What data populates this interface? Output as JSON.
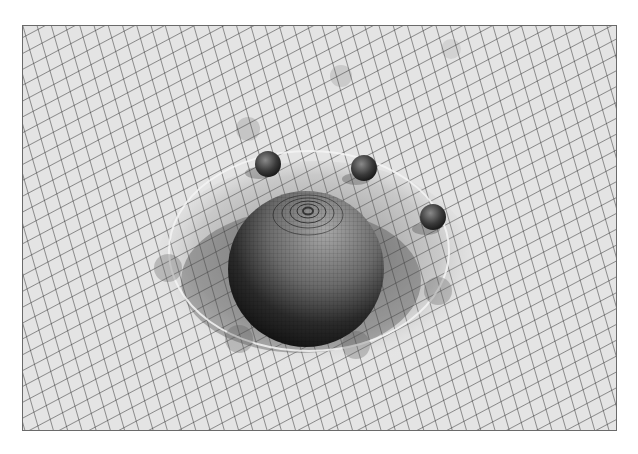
{
  "scene": {
    "description": "Spacetime curvature illustration: large sphere deforming a grid with orbiting small spheres",
    "colors": {
      "background": "#ffffff",
      "grid_surface": "#e4e4e4",
      "grid_line": "#333333",
      "large_sphere_light": "#9a9a9a",
      "large_sphere_dark": "#1e1e1e",
      "small_sphere": "#3a3a3a",
      "orbit_ring": "#f4f4f4"
    },
    "small_spheres": [
      {
        "cx": 267,
        "cy": 163,
        "r": 13,
        "opacity": 1
      },
      {
        "cx": 363,
        "cy": 167,
        "r": 13,
        "opacity": 1
      },
      {
        "cx": 432,
        "cy": 216,
        "r": 13,
        "opacity": 1
      },
      {
        "cx": 247,
        "cy": 128,
        "r": 12,
        "opacity": 0.25
      },
      {
        "cx": 340,
        "cy": 75,
        "r": 11,
        "opacity": 0.2
      },
      {
        "cx": 450,
        "cy": 48,
        "r": 10,
        "opacity": 0.15
      },
      {
        "cx": 167,
        "cy": 267,
        "r": 14,
        "opacity": 0.3
      },
      {
        "cx": 437,
        "cy": 290,
        "r": 14,
        "opacity": 0.3
      },
      {
        "cx": 238,
        "cy": 338,
        "r": 14,
        "opacity": 0.3
      },
      {
        "cx": 355,
        "cy": 344,
        "r": 14,
        "opacity": 0.3
      }
    ]
  }
}
